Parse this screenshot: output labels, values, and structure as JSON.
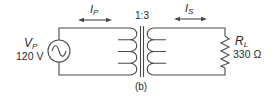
{
  "diagram": {
    "type": "transformer-circuit",
    "caption": "(b)",
    "turns_ratio": "1:3",
    "source": {
      "symbol": "V",
      "subscript": "P",
      "value": "120 V"
    },
    "primary_current": {
      "symbol": "I",
      "subscript": "P"
    },
    "secondary_current": {
      "symbol": "I",
      "subscript": "S"
    },
    "load": {
      "symbol": "R",
      "subscript": "L",
      "value": "330 Ω"
    },
    "colors": {
      "line": "#4a4a4a",
      "text": "#2a2a2a",
      "background": "#ffffff"
    }
  }
}
